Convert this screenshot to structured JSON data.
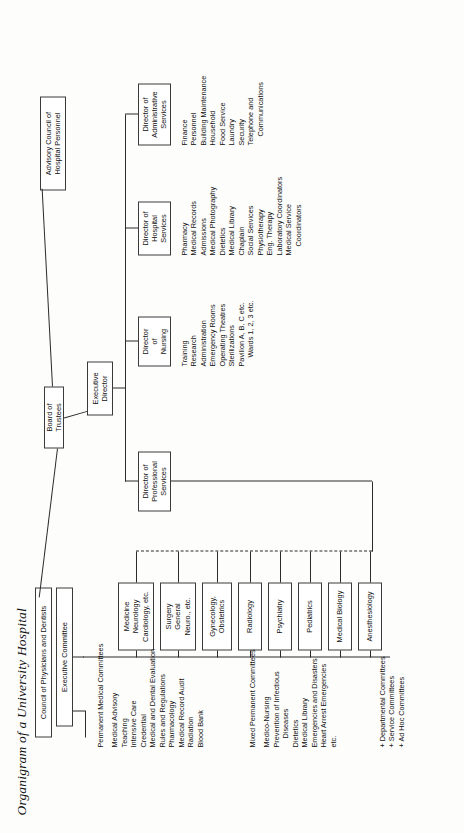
{
  "title": "Organigram of a University Hospital",
  "nodes": {
    "board": "Board of Trustees",
    "advisory": "Advisory Council of\nHospital Personnel",
    "council": "Council of Physicians and Dentists",
    "executive_committee": "Executive Committee",
    "executive_director": "Executive\nDirector",
    "dir_admin": "Director of\nAdministrative\nServices",
    "dir_hospital": "Director of\nHospital\nServices",
    "dir_nursing": "Director\nof\nNursing",
    "dir_professional": "Director of\nProfessional\nServices"
  },
  "departments": [
    {
      "name": "medicine",
      "lines": [
        "Medicine",
        "Neurology",
        "Cardiology, etc."
      ]
    },
    {
      "name": "surgery",
      "lines": [
        "Surgery",
        "General",
        "Neuro., etc."
      ]
    },
    {
      "name": "gynecology",
      "lines": [
        "Gynecology,",
        "Obstetrics"
      ]
    },
    {
      "name": "radiology",
      "lines": [
        "Radiology"
      ]
    },
    {
      "name": "psychiatry",
      "lines": [
        "Psychiatry"
      ]
    },
    {
      "name": "pediatrics",
      "lines": [
        "Pediatrics"
      ]
    },
    {
      "name": "medical-biology",
      "lines": [
        "Medical Biology"
      ]
    },
    {
      "name": "anesthesiology",
      "lines": [
        "Anesthesiology"
      ]
    }
  ],
  "lists": {
    "administrative": {
      "heading": "Director of Administrative Services",
      "items": [
        "Finance",
        "Personnel",
        "Building Maintenance",
        "Household",
        "Food Service",
        "Laundry",
        "Security",
        "Telephone and",
        "Communications"
      ],
      "indented": [
        "Communications"
      ]
    },
    "hospital": {
      "heading": "Director of Hospital Services",
      "items": [
        "Pharmacy",
        "Medical Records",
        "Admissions",
        "Medical Photography",
        "Dietetics",
        "Medical Library",
        "Chaplain",
        "Social Services",
        "Physiotherapy",
        "Eng. Therapy",
        "Laboratory Coordinators",
        "Medical Service",
        "Coordinators"
      ],
      "indented": [
        "Coordinators"
      ]
    },
    "nursing": {
      "heading": "Director of Nursing",
      "items": [
        "Training",
        "Research",
        "Administration",
        "Emergency Rooms",
        "Operating Theatres",
        "Sterilizations",
        "Pavilion A, B, C etc.",
        "Wards 1, 2, 3 etc."
      ],
      "indented": [
        "Wards 1, 2, 3 etc."
      ]
    },
    "permanent_committees": {
      "heading": "Permanent Medical Committees",
      "items": [
        "Medical Advisory",
        "Teaching",
        "Intensive Care",
        "Credential",
        "Medical and Dental Evaluation",
        "Rules and Regulations",
        "Pharmacology",
        "Medical Record Audit",
        "Radiation",
        "Blood Bank"
      ],
      "indented": []
    },
    "mixed_committees": {
      "heading": "Mixed Permanent Committees",
      "items": [
        "Medico-Nursing",
        "Prevention of Infectious",
        "Diseases",
        "Dietetics",
        "Medical Library",
        "Emergencies and Disasters",
        "Heart Arrest Emergencies",
        "etc."
      ],
      "indented": [
        "Diseases"
      ]
    },
    "other_committees": {
      "heading": "Other Committees",
      "items": [
        "+ Departmental Committees",
        "+ Service Committees",
        "+ Ad Hoc Committees"
      ],
      "indented": []
    }
  }
}
